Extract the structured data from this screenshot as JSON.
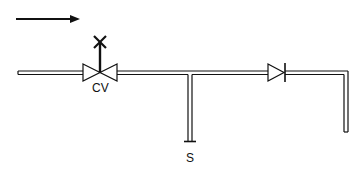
{
  "diagram": {
    "type": "piping-schematic",
    "flow_direction": "left-to-right",
    "colors": {
      "line": "#111111",
      "background": "#ffffff"
    },
    "components": {
      "flow_arrow": {
        "symbol": "arrow-right-icon"
      },
      "control_valve": {
        "label": "CV",
        "symbol": "globe-valve-with-actuator"
      },
      "branch": {
        "label": "S",
        "symbol": "capped-pipe-end"
      },
      "check_valve": {
        "symbol": "check-valve-icon"
      },
      "outlet_pipe": {
        "symbol": "pipe-elbow-down"
      }
    }
  }
}
